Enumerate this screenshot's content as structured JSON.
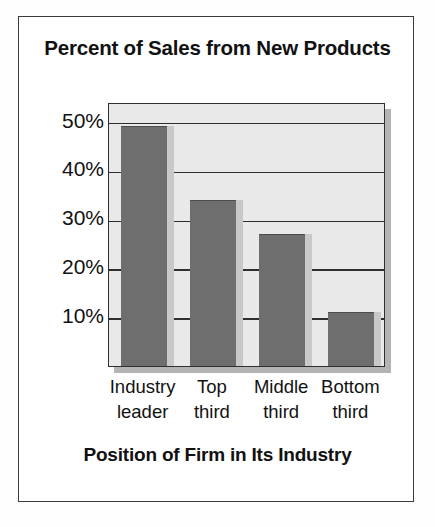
{
  "chart_data": {
    "type": "bar",
    "title": "Percent of Sales from New Products",
    "xlabel": "Position of Firm in Its Industry",
    "ylabel": "",
    "categories": [
      "Industry leader",
      "Top third",
      "Middle third",
      "Bottom third"
    ],
    "category_lines": [
      [
        "Industry",
        "leader"
      ],
      [
        "Top",
        "third"
      ],
      [
        "Middle",
        "third"
      ],
      [
        "Bottom",
        "third"
      ]
    ],
    "values": [
      49,
      34,
      27,
      11
    ],
    "value_labels": [
      "49%",
      "34%",
      "27%",
      "11%"
    ],
    "ylim": [
      0,
      54
    ],
    "yticks": [
      50,
      40,
      30,
      20,
      10
    ],
    "ytick_labels": [
      "50%",
      "40%",
      "30%",
      "20%",
      "10%"
    ],
    "grid": true,
    "legend": false,
    "bar_color": "#6e6e6e",
    "plot_background": "#e9e9e9",
    "frame_color": "#3a3a3a"
  }
}
